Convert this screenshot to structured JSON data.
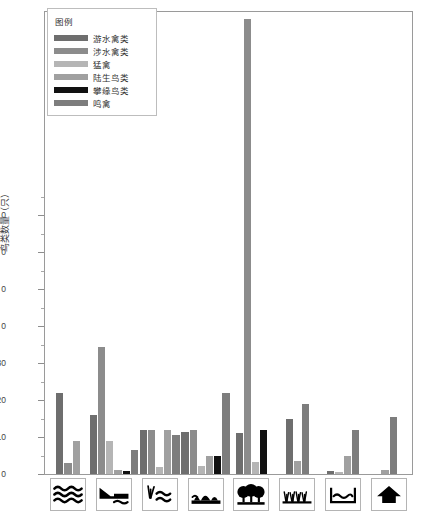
{
  "chart": {
    "type": "bar",
    "title": "",
    "ylabel": "鸟类数量（只）",
    "xlabel": "",
    "legend_title": "图例",
    "legend_position": "top-left-inside",
    "grid": false,
    "ylim": [
      0,
      125
    ],
    "yticks": [
      0,
      10,
      20,
      30,
      0,
      0,
      0,
      0
    ],
    "ytick_labels": [
      "0",
      "10",
      "20",
      "30",
      "0",
      "0",
      "0",
      "0"
    ],
    "series_colors": [
      "#6e6e6e",
      "#8c8c8c",
      "#b5b5b5",
      "#a0a0a0",
      "#111111",
      "#7d7d7d"
    ],
    "series": [
      {
        "name": "游水禽类",
        "color": "#6e6e6e",
        "values": [
          22,
          16,
          12,
          11.5,
          11,
          14.8,
          0.7,
          0
        ]
      },
      {
        "name": "涉水禽类",
        "color": "#8c8c8c",
        "values": [
          3,
          34.5,
          12,
          12,
          123,
          0,
          0,
          0
        ]
      },
      {
        "name": "猛禽",
        "color": "#b5b5b5",
        "values": [
          0,
          9,
          2,
          2.2,
          3.2,
          0,
          0.5,
          0
        ]
      },
      {
        "name": "陆生鸟类",
        "color": "#a0a0a0",
        "values": [
          9,
          1,
          12,
          5,
          0,
          3.5,
          5,
          1
        ]
      },
      {
        "name": "攀缘鸟类",
        "color": "#111111",
        "values": [
          0,
          0.9,
          0,
          5,
          12,
          0,
          0,
          0
        ]
      },
      {
        "name": "鸣禽",
        "color": "#7d7d7d",
        "values": [
          0,
          6.5,
          10.5,
          22,
          0,
          19,
          11.8,
          15.3
        ]
      }
    ],
    "categories": [
      {
        "index": 1,
        "icon": "open-water-waves-icon",
        "label": ""
      },
      {
        "index": 2,
        "icon": "shoreline-slope-water-icon",
        "label": ""
      },
      {
        "index": 3,
        "icon": "reed-marsh-water-icon",
        "label": ""
      },
      {
        "index": 4,
        "icon": "shrub-shoreline-icon",
        "label": ""
      },
      {
        "index": 5,
        "icon": "woodland-trees-icon",
        "label": ""
      },
      {
        "index": 6,
        "icon": "grassland-icon",
        "label": ""
      },
      {
        "index": 7,
        "icon": "pond-basin-icon",
        "label": ""
      },
      {
        "index": 8,
        "icon": "building-house-icon",
        "label": ""
      }
    ]
  }
}
